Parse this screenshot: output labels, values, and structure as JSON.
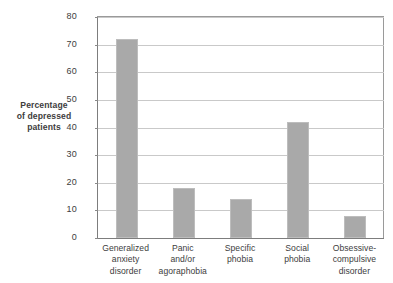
{
  "chart_data": {
    "type": "bar",
    "title": "",
    "xlabel": "",
    "ylabel": "Percentage of depressed patients",
    "ylabel_lines": [
      "Percentage",
      "of depressed",
      "patients"
    ],
    "categories": [
      "Generalized anxiety disorder",
      "Panic and/or agoraphobia",
      "Specific phobia",
      "Social phobia",
      "Obsessive-compulsive disorder"
    ],
    "category_lines": [
      [
        "Generalized",
        "anxiety",
        "disorder"
      ],
      [
        "Panic",
        "and/or",
        "agoraphobia"
      ],
      [
        "Specific",
        "phobia"
      ],
      [
        "Social",
        "phobia"
      ],
      [
        "Obsessive-",
        "compulsive",
        "disorder"
      ]
    ],
    "values": [
      72,
      18,
      14,
      42,
      8
    ],
    "ylim": [
      0,
      80
    ],
    "yticks": [
      0,
      10,
      20,
      30,
      40,
      50,
      60,
      70,
      80
    ],
    "ytick_labels": [
      "0",
      "10",
      "20",
      "30",
      "40",
      "50",
      "60",
      "70",
      "80"
    ],
    "grid": true,
    "legend": false,
    "bar_color": "#a9a9a9",
    "grid_color": "#c9c9c9",
    "axis_color": "#7d7d7d",
    "background": "#ffffff"
  }
}
